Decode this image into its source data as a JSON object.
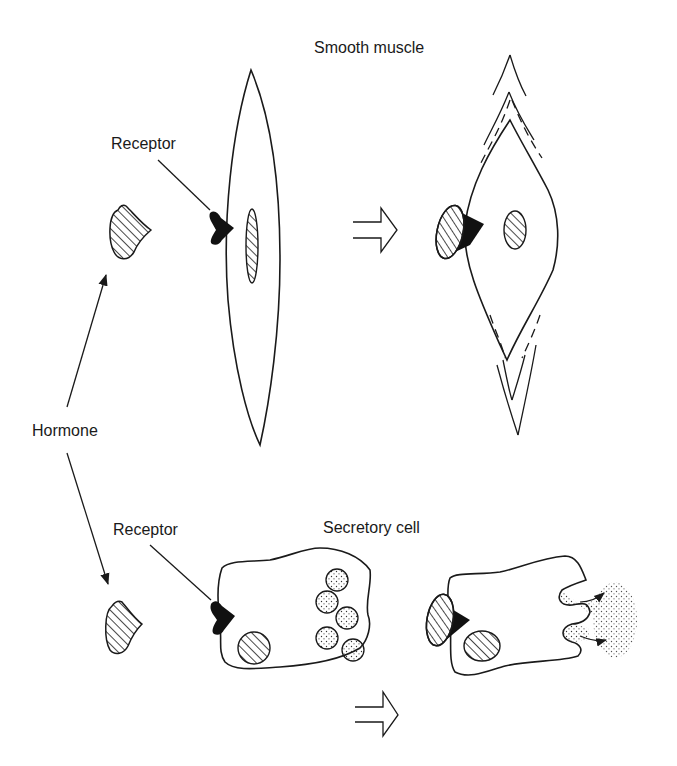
{
  "diagram": {
    "labels": {
      "smooth_muscle": "Smooth muscle",
      "secretory_cell": "Secretory cell",
      "receptor_top": "Receptor",
      "receptor_bottom": "Receptor",
      "hormone": "Hormone"
    },
    "panels": [
      {
        "id": "smooth-muscle",
        "title": "Smooth muscle",
        "before": "relaxed elongated cell with receptor",
        "after": "contracted cell with hormone bound to receptor"
      },
      {
        "id": "secretory-cell",
        "title": "Secretory cell",
        "before": "cell with secretory granules and receptor",
        "after": "hormone bound; granules released by exocytosis"
      }
    ],
    "colors": {
      "ink": "#1a1a1a",
      "background": "#ffffff"
    }
  }
}
